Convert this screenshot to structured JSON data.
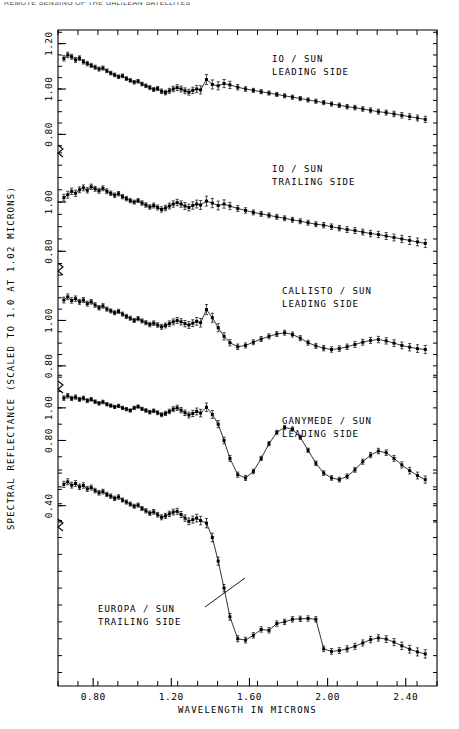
{
  "running_header": "REMOTE SENSING OF THE GALILEAN SATELLITES",
  "axes": {
    "xlabel": "WAVELENGTH IN MICRONS",
    "ylabel": "SPECTRAL REFLECTANCE (SCALED TO 1.0 AT 1.02 MICRONS)",
    "x_ticks": [
      "0.80",
      "1.20",
      "1.60",
      "2.00",
      "2.40"
    ],
    "x_tick_values": [
      0.8,
      1.2,
      1.6,
      2.0,
      2.4
    ],
    "x_range": [
      0.62,
      2.56
    ],
    "y_tick_groups": [
      {
        "labels": [
          "1.20",
          "1.00",
          "0.80"
        ],
        "values": [
          1.2,
          1.0,
          0.8
        ]
      },
      {
        "labels": [
          "1.00",
          "0.80"
        ],
        "values": [
          1.0,
          0.8
        ]
      },
      {
        "labels": [
          "1.00",
          "0.80"
        ],
        "values": [
          1.0,
          0.8
        ]
      },
      {
        "labels": [
          "1.00",
          "0.80",
          "0.40"
        ],
        "values": [
          1.0,
          0.8,
          0.4
        ]
      }
    ],
    "minor_tick_count_x": 19,
    "grid": false
  },
  "panel_labels": [
    {
      "id": "io-leading",
      "line1": "IO / SUN",
      "line2": "LEADING SIDE",
      "x": 272,
      "y": 62
    },
    {
      "id": "io-trailing",
      "line1": "IO / SUN",
      "line2": "TRAILING SIDE",
      "x": 272,
      "y": 172
    },
    {
      "id": "callisto-leading",
      "line1": "CALLISTO / SUN",
      "line2": "LEADING SIDE",
      "x": 282,
      "y": 294
    },
    {
      "id": "ganymede-leading",
      "line1": "GANYMEDE / SUN",
      "line2": "LEADING SIDE",
      "x": 282,
      "y": 424
    },
    {
      "id": "europa-trailing",
      "line1": "EUROPA / SUN",
      "line2": "TRAILING SIDE",
      "x": 98,
      "y": 612
    }
  ],
  "leader_line": {
    "x1": 205,
    "y1": 607,
    "x2": 245,
    "y2": 578
  },
  "colors": {
    "ink": "#000000",
    "background": "#ffffff"
  },
  "chart_data": {
    "type": "line",
    "xlabel": "WAVELENGTH IN MICRONS",
    "ylabel": "SPECTRAL REFLECTANCE (SCALED TO 1.0 AT 1.02 MICRONS)",
    "xlim": [
      0.62,
      2.56
    ],
    "grid": false,
    "legend": "inline-annotations",
    "error_bars": true,
    "marker": "filled-square",
    "series": [
      {
        "name": "IO / SUN LEADING SIDE",
        "ylim": [
          0.74,
          1.26
        ],
        "y_ticks": [
          0.8,
          1.0,
          1.2
        ],
        "x": [
          0.65,
          0.67,
          0.69,
          0.71,
          0.73,
          0.75,
          0.77,
          0.79,
          0.81,
          0.83,
          0.85,
          0.87,
          0.89,
          0.91,
          0.93,
          0.95,
          0.97,
          0.99,
          1.01,
          1.03,
          1.05,
          1.07,
          1.09,
          1.11,
          1.13,
          1.15,
          1.17,
          1.19,
          1.21,
          1.23,
          1.25,
          1.27,
          1.29,
          1.31,
          1.33,
          1.35,
          1.38,
          1.41,
          1.44,
          1.47,
          1.5,
          1.54,
          1.58,
          1.62,
          1.66,
          1.7,
          1.74,
          1.78,
          1.82,
          1.86,
          1.9,
          1.94,
          1.98,
          2.02,
          2.06,
          2.1,
          2.14,
          2.18,
          2.22,
          2.26,
          2.3,
          2.34,
          2.38,
          2.42,
          2.46,
          2.5
        ],
        "y": [
          1.135,
          1.15,
          1.142,
          1.128,
          1.136,
          1.12,
          1.112,
          1.104,
          1.096,
          1.088,
          1.092,
          1.08,
          1.07,
          1.062,
          1.054,
          1.058,
          1.046,
          1.038,
          1.03,
          1.034,
          1.022,
          1.014,
          1.006,
          0.998,
          1.002,
          0.99,
          0.984,
          0.992,
          1.0,
          1.006,
          1.0,
          0.992,
          0.986,
          0.994,
          1.0,
          0.996,
          1.042,
          1.02,
          1.014,
          1.024,
          1.018,
          1.008,
          1.0,
          0.994,
          0.988,
          0.982,
          0.976,
          0.97,
          0.964,
          0.958,
          0.952,
          0.946,
          0.94,
          0.934,
          0.928,
          0.922,
          0.918,
          0.912,
          0.906,
          0.9,
          0.896,
          0.89,
          0.884,
          0.878,
          0.872,
          0.866
        ],
        "err": [
          0.012,
          0.012,
          0.011,
          0.011,
          0.01,
          0.01,
          0.01,
          0.009,
          0.009,
          0.009,
          0.009,
          0.008,
          0.008,
          0.008,
          0.008,
          0.008,
          0.008,
          0.008,
          0.008,
          0.008,
          0.008,
          0.008,
          0.009,
          0.009,
          0.009,
          0.01,
          0.01,
          0.011,
          0.012,
          0.013,
          0.013,
          0.013,
          0.013,
          0.014,
          0.016,
          0.018,
          0.022,
          0.02,
          0.018,
          0.018,
          0.016,
          0.012,
          0.01,
          0.009,
          0.009,
          0.009,
          0.009,
          0.009,
          0.009,
          0.009,
          0.009,
          0.009,
          0.009,
          0.009,
          0.01,
          0.01,
          0.01,
          0.01,
          0.011,
          0.011,
          0.011,
          0.012,
          0.012,
          0.013,
          0.013,
          0.014
        ]
      },
      {
        "name": "IO / SUN TRAILING SIDE",
        "ylim": [
          0.74,
          1.22
        ],
        "y_ticks": [
          0.8,
          1.0
        ],
        "x": [
          0.65,
          0.67,
          0.69,
          0.71,
          0.73,
          0.75,
          0.77,
          0.79,
          0.81,
          0.83,
          0.85,
          0.87,
          0.89,
          0.91,
          0.93,
          0.95,
          0.97,
          0.99,
          1.01,
          1.03,
          1.05,
          1.07,
          1.09,
          1.11,
          1.13,
          1.15,
          1.17,
          1.19,
          1.21,
          1.23,
          1.25,
          1.27,
          1.29,
          1.31,
          1.33,
          1.35,
          1.38,
          1.41,
          1.44,
          1.47,
          1.5,
          1.54,
          1.58,
          1.62,
          1.66,
          1.7,
          1.74,
          1.78,
          1.82,
          1.86,
          1.9,
          1.94,
          1.98,
          2.02,
          2.06,
          2.1,
          2.14,
          2.18,
          2.22,
          2.26,
          2.3,
          2.34,
          2.38,
          2.42,
          2.46,
          2.5
        ],
        "y": [
          1.018,
          1.03,
          1.044,
          1.036,
          1.05,
          1.058,
          1.048,
          1.062,
          1.054,
          1.046,
          1.056,
          1.044,
          1.036,
          1.028,
          1.034,
          1.022,
          1.014,
          1.006,
          1.0,
          1.006,
          0.996,
          0.988,
          0.98,
          0.986,
          0.978,
          0.97,
          0.976,
          0.984,
          0.992,
          0.998,
          0.992,
          0.984,
          0.978,
          0.986,
          0.992,
          0.988,
          1.004,
          0.996,
          0.986,
          0.992,
          0.984,
          0.974,
          0.966,
          0.958,
          0.952,
          0.946,
          0.94,
          0.934,
          0.928,
          0.922,
          0.916,
          0.91,
          0.906,
          0.9,
          0.894,
          0.888,
          0.884,
          0.878,
          0.872,
          0.868,
          0.862,
          0.856,
          0.85,
          0.844,
          0.838,
          0.832
        ],
        "err": [
          0.014,
          0.014,
          0.013,
          0.013,
          0.012,
          0.012,
          0.011,
          0.011,
          0.01,
          0.01,
          0.01,
          0.01,
          0.009,
          0.009,
          0.009,
          0.009,
          0.009,
          0.009,
          0.008,
          0.008,
          0.009,
          0.009,
          0.009,
          0.01,
          0.01,
          0.011,
          0.011,
          0.012,
          0.013,
          0.013,
          0.013,
          0.014,
          0.014,
          0.015,
          0.016,
          0.018,
          0.02,
          0.019,
          0.018,
          0.017,
          0.015,
          0.012,
          0.011,
          0.01,
          0.01,
          0.01,
          0.01,
          0.01,
          0.01,
          0.01,
          0.01,
          0.01,
          0.011,
          0.011,
          0.011,
          0.012,
          0.012,
          0.012,
          0.013,
          0.013,
          0.014,
          0.014,
          0.015,
          0.016,
          0.016,
          0.017
        ]
      },
      {
        "name": "CALLISTO / SUN LEADING SIDE",
        "ylim": [
          0.72,
          1.24
        ],
        "y_ticks": [
          0.8,
          1.0
        ],
        "x": [
          0.65,
          0.67,
          0.69,
          0.71,
          0.73,
          0.75,
          0.77,
          0.79,
          0.81,
          0.83,
          0.85,
          0.87,
          0.89,
          0.91,
          0.93,
          0.95,
          0.97,
          0.99,
          1.01,
          1.03,
          1.05,
          1.07,
          1.09,
          1.11,
          1.13,
          1.15,
          1.17,
          1.19,
          1.21,
          1.23,
          1.25,
          1.27,
          1.29,
          1.31,
          1.33,
          1.35,
          1.38,
          1.41,
          1.44,
          1.47,
          1.5,
          1.54,
          1.58,
          1.62,
          1.66,
          1.7,
          1.74,
          1.78,
          1.82,
          1.86,
          1.9,
          1.94,
          1.98,
          2.02,
          2.06,
          2.1,
          2.14,
          2.18,
          2.22,
          2.26,
          2.3,
          2.34,
          2.38,
          2.42,
          2.46,
          2.5
        ],
        "y": [
          1.09,
          1.104,
          1.088,
          1.096,
          1.082,
          1.09,
          1.074,
          1.082,
          1.068,
          1.056,
          1.064,
          1.05,
          1.042,
          1.034,
          1.04,
          1.028,
          1.018,
          1.01,
          1.0,
          1.008,
          0.998,
          0.99,
          0.982,
          0.988,
          0.98,
          0.972,
          0.978,
          0.986,
          0.994,
          1.0,
          0.994,
          0.986,
          0.98,
          0.988,
          0.996,
          0.99,
          1.048,
          1.012,
          0.968,
          0.93,
          0.902,
          0.884,
          0.89,
          0.904,
          0.918,
          0.93,
          0.94,
          0.946,
          0.938,
          0.922,
          0.902,
          0.888,
          0.878,
          0.872,
          0.876,
          0.884,
          0.894,
          0.904,
          0.912,
          0.916,
          0.91,
          0.9,
          0.89,
          0.882,
          0.876,
          0.872
        ],
        "err": [
          0.013,
          0.013,
          0.012,
          0.012,
          0.011,
          0.011,
          0.011,
          0.01,
          0.01,
          0.01,
          0.01,
          0.009,
          0.009,
          0.009,
          0.009,
          0.009,
          0.009,
          0.009,
          0.009,
          0.009,
          0.009,
          0.009,
          0.01,
          0.01,
          0.01,
          0.011,
          0.011,
          0.012,
          0.013,
          0.013,
          0.014,
          0.014,
          0.015,
          0.015,
          0.017,
          0.019,
          0.022,
          0.02,
          0.018,
          0.016,
          0.014,
          0.012,
          0.011,
          0.011,
          0.011,
          0.011,
          0.011,
          0.011,
          0.011,
          0.011,
          0.011,
          0.011,
          0.012,
          0.012,
          0.012,
          0.012,
          0.013,
          0.013,
          0.013,
          0.014,
          0.014,
          0.015,
          0.015,
          0.016,
          0.017,
          0.018
        ]
      },
      {
        "name": "GANYMEDE / SUN LEADING SIDE",
        "ylim": [
          0.3,
          1.22
        ],
        "y_ticks": [
          0.4,
          0.8,
          1.0
        ],
        "x": [
          0.65,
          0.67,
          0.69,
          0.71,
          0.73,
          0.75,
          0.77,
          0.79,
          0.81,
          0.83,
          0.85,
          0.87,
          0.89,
          0.91,
          0.93,
          0.95,
          0.97,
          0.99,
          1.01,
          1.03,
          1.05,
          1.07,
          1.09,
          1.11,
          1.13,
          1.15,
          1.17,
          1.19,
          1.21,
          1.23,
          1.25,
          1.27,
          1.29,
          1.31,
          1.33,
          1.35,
          1.38,
          1.41,
          1.44,
          1.47,
          1.5,
          1.54,
          1.58,
          1.62,
          1.66,
          1.7,
          1.74,
          1.78,
          1.82,
          1.86,
          1.9,
          1.94,
          1.98,
          2.02,
          2.06,
          2.1,
          2.14,
          2.18,
          2.22,
          2.26,
          2.3,
          2.34,
          2.38,
          2.42,
          2.46,
          2.5
        ],
        "y": [
          1.06,
          1.074,
          1.058,
          1.066,
          1.052,
          1.06,
          1.044,
          1.052,
          1.038,
          1.028,
          1.036,
          1.022,
          1.014,
          1.006,
          1.012,
          1.0,
          0.992,
          0.984,
          1.0,
          1.008,
          0.994,
          0.984,
          0.974,
          0.982,
          0.97,
          0.958,
          0.966,
          0.978,
          0.992,
          1.0,
          0.986,
          0.97,
          0.956,
          0.966,
          0.978,
          0.968,
          1.004,
          0.96,
          0.9,
          0.8,
          0.69,
          0.59,
          0.57,
          0.61,
          0.69,
          0.78,
          0.85,
          0.88,
          0.87,
          0.82,
          0.74,
          0.66,
          0.6,
          0.57,
          0.56,
          0.58,
          0.62,
          0.67,
          0.71,
          0.735,
          0.725,
          0.69,
          0.65,
          0.615,
          0.585,
          0.56
        ],
        "err": [
          0.014,
          0.014,
          0.013,
          0.013,
          0.012,
          0.012,
          0.012,
          0.011,
          0.011,
          0.011,
          0.011,
          0.01,
          0.01,
          0.01,
          0.01,
          0.01,
          0.01,
          0.01,
          0.01,
          0.01,
          0.01,
          0.011,
          0.011,
          0.011,
          0.012,
          0.012,
          0.013,
          0.014,
          0.015,
          0.016,
          0.016,
          0.017,
          0.018,
          0.019,
          0.021,
          0.023,
          0.026,
          0.024,
          0.022,
          0.02,
          0.018,
          0.016,
          0.015,
          0.014,
          0.013,
          0.013,
          0.013,
          0.013,
          0.013,
          0.013,
          0.013,
          0.014,
          0.014,
          0.014,
          0.015,
          0.015,
          0.015,
          0.016,
          0.016,
          0.017,
          0.017,
          0.018,
          0.019,
          0.02,
          0.021,
          0.022
        ]
      },
      {
        "name": "EUROPA / SUN TRAILING SIDE",
        "ylim": [
          0.02,
          1.3
        ],
        "y_ticks": [],
        "x": [
          0.65,
          0.67,
          0.69,
          0.71,
          0.73,
          0.75,
          0.77,
          0.79,
          0.81,
          0.83,
          0.85,
          0.87,
          0.89,
          0.91,
          0.93,
          0.95,
          0.97,
          0.99,
          1.01,
          1.03,
          1.05,
          1.07,
          1.09,
          1.11,
          1.13,
          1.15,
          1.17,
          1.19,
          1.21,
          1.23,
          1.25,
          1.27,
          1.29,
          1.31,
          1.33,
          1.35,
          1.38,
          1.41,
          1.44,
          1.47,
          1.5,
          1.54,
          1.58,
          1.62,
          1.66,
          1.7,
          1.74,
          1.78,
          1.82,
          1.86,
          1.9,
          1.94,
          1.98,
          2.02,
          2.06,
          2.1,
          2.14,
          2.18,
          2.22,
          2.26,
          2.3,
          2.34,
          2.38,
          2.42,
          2.46,
          2.5
        ],
        "y": [
          1.215,
          1.23,
          1.21,
          1.22,
          1.2,
          1.208,
          1.188,
          1.196,
          1.178,
          1.165,
          1.172,
          1.155,
          1.145,
          1.132,
          1.14,
          1.122,
          1.11,
          1.098,
          1.085,
          1.092,
          1.072,
          1.058,
          1.044,
          1.052,
          1.035,
          1.02,
          1.028,
          1.04,
          1.05,
          1.055,
          1.036,
          1.015,
          0.996,
          1.006,
          1.015,
          1.0,
          0.985,
          0.9,
          0.76,
          0.6,
          0.43,
          0.3,
          0.292,
          0.32,
          0.355,
          0.35,
          0.39,
          0.4,
          0.415,
          0.418,
          0.42,
          0.415,
          0.24,
          0.225,
          0.23,
          0.24,
          0.255,
          0.275,
          0.295,
          0.305,
          0.298,
          0.28,
          0.258,
          0.238,
          0.222,
          0.21
        ],
        "err": [
          0.018,
          0.018,
          0.017,
          0.017,
          0.016,
          0.016,
          0.015,
          0.015,
          0.014,
          0.014,
          0.014,
          0.013,
          0.013,
          0.013,
          0.013,
          0.012,
          0.012,
          0.012,
          0.012,
          0.012,
          0.012,
          0.013,
          0.013,
          0.014,
          0.014,
          0.015,
          0.015,
          0.016,
          0.017,
          0.018,
          0.018,
          0.019,
          0.02,
          0.021,
          0.023,
          0.025,
          0.028,
          0.026,
          0.024,
          0.022,
          0.02,
          0.018,
          0.017,
          0.016,
          0.016,
          0.016,
          0.016,
          0.016,
          0.016,
          0.016,
          0.016,
          0.016,
          0.017,
          0.017,
          0.017,
          0.018,
          0.018,
          0.018,
          0.019,
          0.019,
          0.02,
          0.021,
          0.022,
          0.023,
          0.024,
          0.025
        ]
      }
    ]
  }
}
